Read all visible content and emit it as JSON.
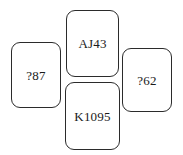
{
  "diagram": {
    "type": "bridge-hand-cross-layout",
    "background_color": "#ffffff",
    "border_color": "#2b2b2b",
    "text_color": "#1a1a1a",
    "cards": [
      {
        "position": "north",
        "label": "AJ43"
      },
      {
        "position": "west",
        "label": "?87"
      },
      {
        "position": "east",
        "label": "?62"
      },
      {
        "position": "south",
        "label": "K1095"
      }
    ]
  }
}
